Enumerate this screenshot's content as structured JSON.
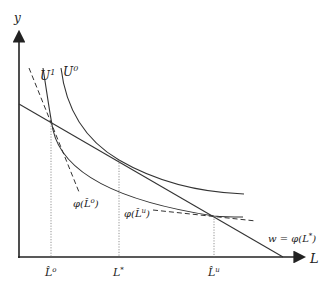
{
  "diagram": {
    "axes": {
      "y_label": "y",
      "x_label": "L"
    },
    "curves": {
      "u1_label": "U",
      "u1_sup": "1",
      "u0_label": "U",
      "u0_sup": "0"
    },
    "tangent_labels": {
      "left_phi": "φ(L̂",
      "left_sup": "o",
      "left_close": ")",
      "right_phi": "φ(L̂",
      "right_sup": "u",
      "right_close": ")"
    },
    "wage_line_label": "w = φ(L",
    "wage_line_sup": "*",
    "wage_line_close": ")",
    "x_ticks": [
      {
        "base": "L̂",
        "sup": "o"
      },
      {
        "base": "L",
        "sup": "*"
      },
      {
        "base": "L̂",
        "sup": "u"
      }
    ]
  }
}
